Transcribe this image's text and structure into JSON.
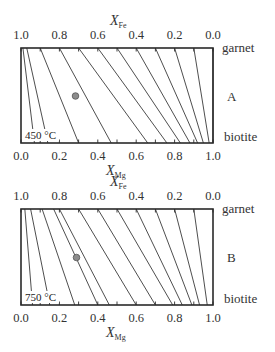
{
  "panels": [
    {
      "id": "A",
      "label": "A",
      "temperature": "450 °C",
      "top_axis": {
        "title": "X",
        "subscript": "Fe",
        "ticks": [
          "1.0",
          "0.8",
          "0.6",
          "0.4",
          "0.2",
          "0.0"
        ]
      },
      "bottom_axis": {
        "title": "X",
        "subscript": "Mg",
        "ticks": [
          "0.0",
          "0.2",
          "0.4",
          "0.6",
          "0.8",
          "1.0"
        ]
      },
      "top_phase": "garnet",
      "bottom_phase": "biotite",
      "frame": {
        "x0": 21,
        "y0": 48,
        "x1": 213,
        "y1": 143
      },
      "tie_lines": [
        {
          "top": 0.01,
          "bottom": 0.07
        },
        {
          "top": 0.03,
          "bottom": 0.14
        },
        {
          "top": 0.1,
          "bottom": 0.3
        },
        {
          "top": 0.2,
          "bottom": 0.47
        },
        {
          "top": 0.3,
          "bottom": 0.66
        },
        {
          "top": 0.4,
          "bottom": 0.76
        },
        {
          "top": 0.5,
          "bottom": 0.83
        },
        {
          "top": 0.6,
          "bottom": 0.88
        },
        {
          "top": 0.7,
          "bottom": 0.92
        },
        {
          "top": 0.8,
          "bottom": 0.95
        },
        {
          "top": 0.9,
          "bottom": 0.98
        },
        {
          "top": 1.0,
          "bottom": 1.0
        }
      ],
      "point": {
        "x": 75.5,
        "y": 96
      }
    },
    {
      "id": "B",
      "label": "B",
      "temperature": "750 °C",
      "top_axis": {
        "title": "X",
        "subscript": "Fe",
        "ticks": [
          "1.0",
          "0.8",
          "0.6",
          "0.4",
          "0.2",
          "0.0"
        ]
      },
      "bottom_axis": {
        "title": "X",
        "subscript": "Mg",
        "ticks": [
          "0.0",
          "0.2",
          "0.4",
          "0.6",
          "0.8",
          "1.0"
        ]
      },
      "top_phase": "garnet",
      "bottom_phase": "biotite",
      "frame": {
        "x0": 21,
        "y0": 209,
        "x1": 213,
        "y1": 305
      },
      "tie_lines": [
        {
          "top": 0.02,
          "bottom": 0.06
        },
        {
          "top": 0.05,
          "bottom": 0.15
        },
        {
          "top": 0.11,
          "bottom": 0.28
        },
        {
          "top": 0.17,
          "bottom": 0.4
        },
        {
          "top": 0.2,
          "bottom": 0.46
        },
        {
          "top": 0.3,
          "bottom": 0.6
        },
        {
          "top": 0.4,
          "bottom": 0.7
        },
        {
          "top": 0.5,
          "bottom": 0.79
        },
        {
          "top": 0.6,
          "bottom": 0.84
        },
        {
          "top": 0.7,
          "bottom": 0.89
        },
        {
          "top": 0.8,
          "bottom": 0.93
        },
        {
          "top": 0.9,
          "bottom": 0.97
        }
      ],
      "point": {
        "x": 76.5,
        "y": 257.5
      }
    }
  ],
  "colors": {
    "line": "#3a3a3a",
    "frame": "#2a2a2a",
    "point_fill": "#8c8c8c",
    "point_stroke": "#555555"
  }
}
